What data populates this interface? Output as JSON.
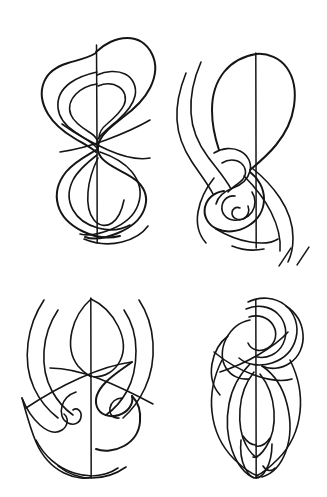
{
  "page": {
    "background_color": "#ffffff",
    "ink_color": "#151515",
    "width": 327,
    "height": 497,
    "layout": "2x2 grid of untitled figures",
    "caption": ""
  },
  "figures": [
    {
      "id": "figure-top-left",
      "name": "figure-eight nested contours",
      "position": "top-left",
      "axis_label": "vertical symmetry axis",
      "axis_x": 97,
      "axis_y_top": 45,
      "axis_y_bottom": 243,
      "stroke_count": 6,
      "description": "Nested closed loops forming a double-lobed figure-eight with a waist crossing near mid-height"
    },
    {
      "id": "figure-top-right",
      "name": "spiral with trailing contours",
      "position": "top-right",
      "axis_label": "vertical symmetry axis",
      "axis_x": 256,
      "axis_y_top": 53,
      "axis_y_bottom": 248,
      "stroke_count": 7,
      "description": "Rounded upper lobe above a tight inward spiral, with long parallel contour lines sweeping down the left side"
    },
    {
      "id": "figure-bottom-left",
      "name": "mirrored scroll curls",
      "position": "bottom-left",
      "axis_label": "vertical symmetry axis",
      "axis_x": 91,
      "axis_y_top": 298,
      "axis_y_bottom": 478,
      "stroke_count": 6,
      "description": "Pointed ogival top lobe over two mirrored inward scroll curls flanked by arcing horns"
    },
    {
      "id": "figure-bottom-right",
      "name": "coiled knot over teardrop body",
      "position": "bottom-right",
      "axis_label": "vertical symmetry axis",
      "axis_x": 256,
      "axis_y_top": 300,
      "axis_y_bottom": 478,
      "stroke_count": 8,
      "description": "Dense coiled knot at the top resolving into an elongated teardrop body with paired tails"
    }
  ],
  "marks": {
    "stray_strokes": [
      {
        "name": "stray-diagonal-1",
        "x1": 279,
        "y1": 266,
        "x2": 291,
        "y2": 248
      },
      {
        "name": "stray-diagonal-2",
        "x1": 297,
        "y1": 265,
        "x2": 309,
        "y2": 247
      }
    ]
  }
}
